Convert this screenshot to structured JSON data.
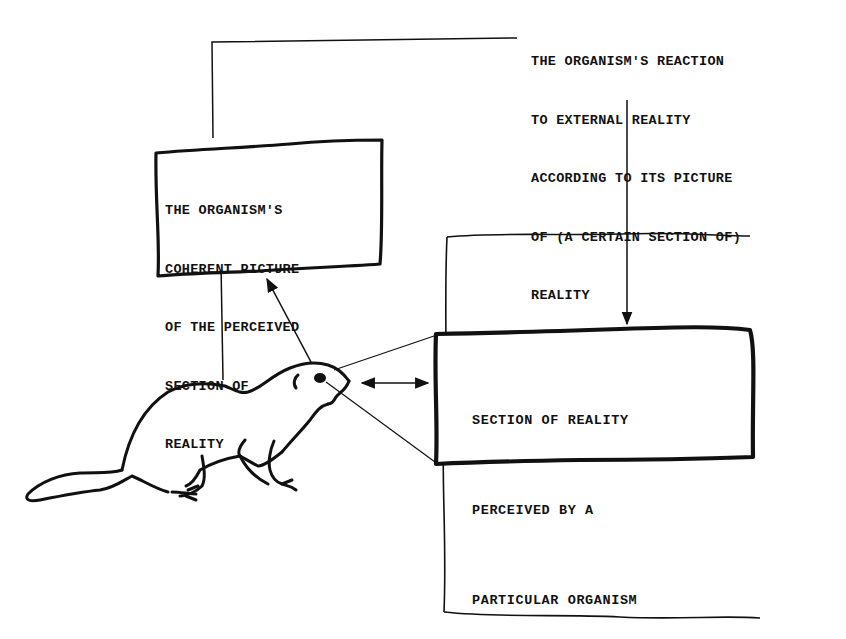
{
  "diagram": {
    "reaction_note": {
      "lines": [
        "THE ORGANISM'S REACTION",
        "TO EXTERNAL REALITY",
        "ACCORDING TO ITS PICTURE",
        "OF (A CERTAIN SECTION OF)",
        "REALITY"
      ]
    },
    "picture_box": {
      "lines": [
        "THE ORGANISM'S",
        "COHERENT PICTURE",
        "OF THE PERCEIVED",
        "SECTION OF",
        "REALITY"
      ]
    },
    "section_box": {
      "lines": [
        "SECTION OF REALITY",
        "PERCEIVED BY A",
        "PARTICULAR ORGANISM"
      ]
    },
    "figures": {
      "organism": "marmot-drawing",
      "reality_frame": "external-reality-frame"
    },
    "colors": {
      "ink": "#111111",
      "background": "#ffffff"
    }
  }
}
